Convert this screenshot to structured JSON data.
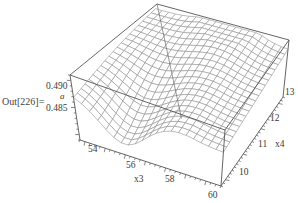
{
  "cell": {
    "out_label": "Out[226]="
  },
  "chart_data": {
    "type": "surface3d",
    "title": "",
    "zlabel": "a",
    "xlabel": "x3",
    "ylabel": "x4",
    "x_ticks": [
      "54",
      "56",
      "58",
      "60"
    ],
    "y_ticks": [
      "10",
      "11",
      "12",
      "13"
    ],
    "z_ticks": [
      "0.485",
      "0.490"
    ],
    "x_range": [
      53,
      60
    ],
    "y_range": [
      9.5,
      13.2
    ],
    "z_range": [
      0.481,
      0.493
    ],
    "grid": {
      "x_lines": 20,
      "y_lines": 20
    },
    "surface_description": "Plateau near a≈0.490 at low x3, dropping to ≈0.484 around x3≈55-56 for low x4; high-x4 back region elevated ≈0.491 with a ridge near x3≈57-59, x4≈12-13",
    "mesh_color": "#8a8a8a",
    "box_color": "#555555"
  },
  "labels": {
    "z_0490": "0.490",
    "z_0485": "0.485",
    "z_name": "a",
    "x_54": "54",
    "x_56": "56",
    "x_58": "58",
    "x_60": "60",
    "x_name": "x3",
    "y_10": "10",
    "y_11": "11",
    "y_12": "12",
    "y_13": "13",
    "y_name": "x4"
  }
}
